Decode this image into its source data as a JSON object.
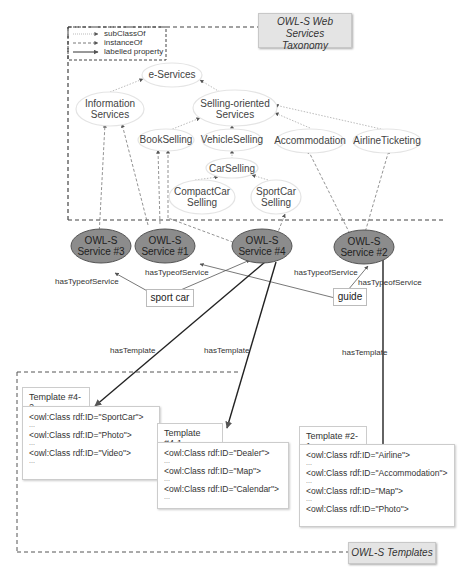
{
  "taxonomy": {
    "title_line1": "OWL-S Web Services",
    "title_line2": "Taxonomy",
    "legend": [
      {
        "label": "subClassOf",
        "style": "dotted"
      },
      {
        "label": "instanceOf",
        "style": "dashed"
      },
      {
        "label": "labelled property",
        "style": "solid"
      }
    ],
    "classes": [
      {
        "id": "e-services",
        "line1": "e-Services",
        "line2": ""
      },
      {
        "id": "information-services",
        "line1": "Information",
        "line2": "Services"
      },
      {
        "id": "selling-oriented-services",
        "line1": "Selling-oriented",
        "line2": "Services"
      },
      {
        "id": "bookselling",
        "line1": "BookSelling",
        "line2": ""
      },
      {
        "id": "vehicleselling",
        "line1": "VehicleSelling",
        "line2": ""
      },
      {
        "id": "accommodation",
        "line1": "Accommodation",
        "line2": ""
      },
      {
        "id": "airlineticketing",
        "line1": "AirlineTicketing",
        "line2": ""
      },
      {
        "id": "carselling",
        "line1": "CarSelling",
        "line2": ""
      },
      {
        "id": "compactcar-selling",
        "line1": "CompactCar",
        "line2": "Selling"
      },
      {
        "id": "sportcar-selling",
        "line1": "SportCar",
        "line2": "Selling"
      }
    ]
  },
  "services": [
    {
      "id": "service-3",
      "line1": "OWL-S",
      "line2": "Service #3"
    },
    {
      "id": "service-1",
      "line1": "OWL-S",
      "line2": "Service #1"
    },
    {
      "id": "service-4",
      "line1": "OWL-S",
      "line2": "Service #4"
    },
    {
      "id": "service-2",
      "line1": "OWL-S",
      "line2": "Service #2"
    }
  ],
  "literals": [
    {
      "id": "sport-car",
      "label": "sport car"
    },
    {
      "id": "guide",
      "label": "guide"
    }
  ],
  "edge_labels": {
    "has_type_of_service": "hasTypeofService",
    "has_template": "hasTemplate"
  },
  "templates_section": {
    "title": "OWL-S Templates",
    "templates": [
      {
        "id": "template-4-2",
        "title": "Template #4-2",
        "lines": [
          "<owl:Class rdf:ID=\"SportCar\">",
          "...",
          "<owl:Class rdf:ID=\"Photo\">",
          "...",
          "<owl:Class rdf:ID=\"Video\">",
          "..."
        ]
      },
      {
        "id": "template-4-1",
        "title": "Template #4-1",
        "lines": [
          "<owl:Class rdf:ID=\"Dealer\">",
          "...",
          "<owl:Class rdf:ID=\"Map\">",
          "...",
          "<owl:Class rdf:ID=\"Calendar\">",
          "..."
        ]
      },
      {
        "id": "template-2-1",
        "title": "Template #2-1",
        "lines": [
          "<owl:Class rdf:ID=\"Airline\">",
          "...",
          "<owl:Class rdf:ID=\"Accommodation\">",
          "...",
          "<owl:Class rdf:ID=\"Map\">",
          "...",
          "<owl:Class rdf:ID=\"Photo\">"
        ]
      }
    ]
  },
  "colors": {
    "service_fill": "#8c8c8c",
    "class_fill": "#ffffff",
    "title_box_fill": "#e4e4e4"
  }
}
